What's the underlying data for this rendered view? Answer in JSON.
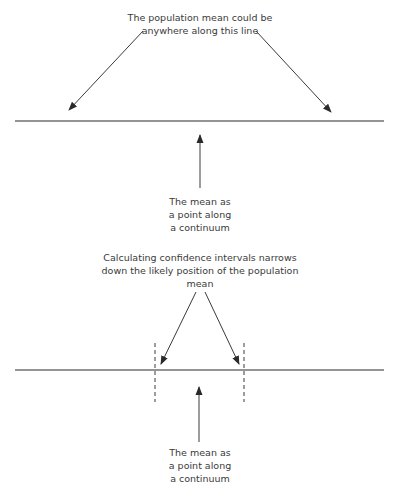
{
  "top_panel": {
    "caption_lines": [
      "The population mean could be",
      "anywhere along this line"
    ],
    "mean_label_lines": [
      "The mean as",
      "a point along",
      "a continuum"
    ]
  },
  "bottom_panel": {
    "caption_lines": [
      "Calculating confidence intervals narrows",
      "down the likely position of the population",
      "mean"
    ],
    "mean_label_lines": [
      "The mean as",
      "a point along",
      "a continuum"
    ]
  },
  "colors": {
    "ink": "#3a3a3a",
    "line": "#2a2a2a"
  }
}
